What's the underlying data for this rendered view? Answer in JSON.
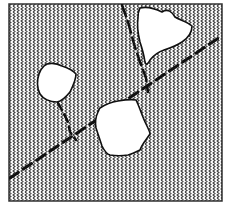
{
  "diagram": {
    "frame": {
      "x": 9,
      "y": 4,
      "width": 213,
      "height": 197,
      "stroke": "#333333"
    },
    "hatch": {
      "color": "#444444",
      "spacing_x": 4,
      "wave_period_y": 6
    },
    "colors": {
      "background": "#ffffff",
      "line": "#111111",
      "void_fill": "#ffffff"
    },
    "inclusions": [
      {
        "id": "left-blob",
        "label": "",
        "center": [
          57,
          80
        ]
      },
      {
        "id": "top-right-blob",
        "label": "",
        "center": [
          165,
          30
        ]
      },
      {
        "id": "center-bottom-blob",
        "label": "",
        "center": [
          122,
          128
        ]
      }
    ],
    "cracks": [
      {
        "id": "main-diagonal-crack",
        "from": [
          10,
          178
        ],
        "to": [
          220,
          37
        ],
        "style": "dashed"
      },
      {
        "id": "upper-branch-crack",
        "from": [
          122,
          5
        ],
        "to": [
          148,
          92
        ],
        "style": "dashed"
      },
      {
        "id": "left-branch-crack",
        "from": [
          58,
          103
        ],
        "to": [
          76,
          140
        ],
        "style": "dashed"
      }
    ]
  }
}
